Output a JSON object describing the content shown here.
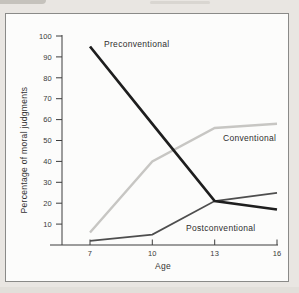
{
  "figure": {
    "page_background": "#e9e6e2",
    "plot_background": "#fcfcfb",
    "frame_color": "#8a8a88",
    "axis_color": "#3d3d3d",
    "text_color": "#333333"
  },
  "chart_data": {
    "type": "line",
    "title": "",
    "xlabel": "Age",
    "ylabel": "Percentage of moral judgments",
    "x": [
      7,
      10,
      13,
      16
    ],
    "xtick_labels": [
      "7",
      "10",
      "13",
      "16"
    ],
    "yticks": [
      10,
      20,
      30,
      40,
      50,
      60,
      70,
      80,
      90,
      100
    ],
    "xlim": [
      7,
      16
    ],
    "ylim": [
      0,
      100
    ],
    "grid": false,
    "legend": "inline-labels",
    "series": [
      {
        "name": "Preconventional",
        "values": [
          95,
          58,
          21,
          17
        ],
        "color": "#1e1e1e",
        "width": 2.7
      },
      {
        "name": "Conventional",
        "values": [
          6,
          40,
          56,
          58
        ],
        "color": "#c7c6c3",
        "width": 2.4
      },
      {
        "name": "Postconventional",
        "values": [
          2,
          5,
          21,
          25
        ],
        "color": "#4e4e4e",
        "width": 1.7
      }
    ]
  }
}
